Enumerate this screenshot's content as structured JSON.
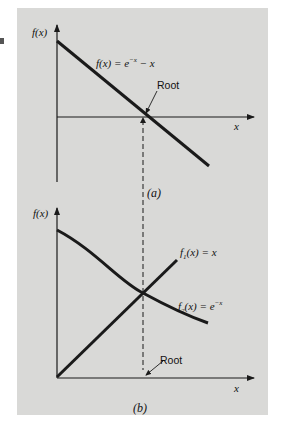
{
  "figure": {
    "panel_background": "#d9d9d7",
    "line_color": "#1a1a1a",
    "panels": [
      {
        "id": "a",
        "caption": "(a)",
        "y_axis_label": "f(x)",
        "x_axis_label": "x",
        "curves": [
          {
            "name": "f(x) = e^-x - x",
            "label_main": "f(x) = e",
            "label_sup": "−x",
            "label_tail": " − x"
          }
        ],
        "annotation": "Root"
      },
      {
        "id": "b",
        "caption": "(b)",
        "y_axis_label": "f(x)",
        "x_axis_label": "x",
        "curves": [
          {
            "name": "f1(x) = x",
            "label_f": "f",
            "label_sub": "1",
            "label_rest": "(x) = x"
          },
          {
            "name": "f2(x) = e^-x",
            "label_f": "f",
            "label_sub": "2",
            "label_rest": "(x) = e",
            "label_sup": "−x"
          }
        ],
        "annotation": "Root"
      }
    ],
    "connector": "dashed vertical line linking root in (a) to root in (b)"
  }
}
